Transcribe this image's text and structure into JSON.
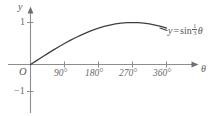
{
  "figure": {
    "background_color": "#ffffff",
    "ink_color": "#555555",
    "axis_color": "#8a8a8a"
  },
  "axes": {
    "y_axis_name": "y",
    "x_axis_name": "θ",
    "origin_label": "O",
    "y_ticks": [
      {
        "label": "1",
        "value": 1
      },
      {
        "label": "−1",
        "value": -1
      }
    ],
    "x_ticks": [
      {
        "label": "90°",
        "value": 90
      },
      {
        "label": "180°",
        "value": 180
      },
      {
        "label": "270°",
        "value": 270
      },
      {
        "label": "360°",
        "value": 360
      }
    ]
  },
  "curve_label": {
    "lhs": "y",
    "equals": "=",
    "function": "sin",
    "fraction_numerator": "1",
    "fraction_denominator": "3",
    "variable": "θ",
    "full_text": "y = sin 1/3 θ"
  },
  "chart_data": {
    "type": "line",
    "title": "",
    "xlabel": "θ",
    "ylabel": "y",
    "xlim": [
      0,
      390
    ],
    "ylim": [
      -1.35,
      1.35
    ],
    "grid": false,
    "legend": "none",
    "annotations": [
      {
        "text": "y = sin 1/3 θ",
        "x": 375,
        "y": 0.85
      }
    ],
    "series": [
      {
        "name": "y = sin(θ/3)",
        "x": [
          0,
          15,
          30,
          45,
          60,
          75,
          90,
          105,
          120,
          135,
          150,
          165,
          180,
          195,
          210,
          225,
          240,
          255,
          270,
          285,
          300,
          315,
          330,
          345,
          360
        ],
        "values": [
          0,
          0.087,
          0.174,
          0.259,
          0.342,
          0.423,
          0.5,
          0.574,
          0.643,
          0.707,
          0.766,
          0.819,
          0.866,
          0.906,
          0.94,
          0.966,
          0.985,
          0.996,
          1.0,
          0.996,
          0.985,
          0.966,
          0.94,
          0.906,
          0.866
        ]
      }
    ]
  }
}
